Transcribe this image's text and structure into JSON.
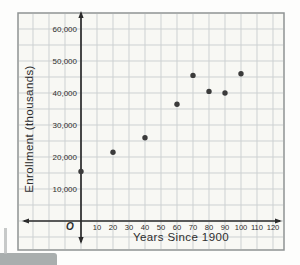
{
  "figure": {
    "origin_label": "O",
    "paper_color": "#f8f8f4",
    "border_color": "#8f9393",
    "grid_color": "#cdd1d2",
    "axis_color": "#2b2b2b",
    "point_color": "#3b3b3b"
  },
  "chart_data": {
    "type": "scatter",
    "title": "",
    "xlabel": "Years Since 1900",
    "ylabel": "Enrollment (thousands)",
    "x_ticks": [
      10,
      20,
      30,
      40,
      50,
      60,
      70,
      80,
      90,
      100,
      110,
      120
    ],
    "x_tick_labels": [
      "10",
      "20",
      "30",
      "40",
      "50",
      "60",
      "70",
      "80",
      "90",
      "100",
      "110",
      "120"
    ],
    "y_ticks": [
      10000,
      20000,
      30000,
      40000,
      50000,
      60000
    ],
    "y_tick_labels": [
      "10,000",
      "20,000",
      "30,000",
      "40,000",
      "50,000",
      "60,000"
    ],
    "xlim": [
      0,
      120
    ],
    "ylim": [
      0,
      60000
    ],
    "grid": true,
    "legend": null,
    "points": [
      {
        "x": 0,
        "y": 15500
      },
      {
        "x": 20,
        "y": 21500
      },
      {
        "x": 40,
        "y": 26000
      },
      {
        "x": 60,
        "y": 36500
      },
      {
        "x": 70,
        "y": 45500
      },
      {
        "x": 80,
        "y": 40500
      },
      {
        "x": 90,
        "y": 40000
      },
      {
        "x": 100,
        "y": 46000
      }
    ]
  }
}
